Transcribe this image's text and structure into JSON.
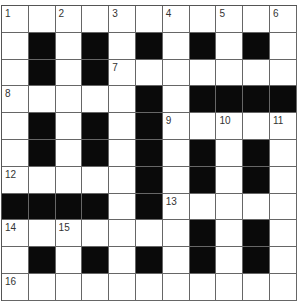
{
  "puzzle": {
    "title_partial": "Everyday Things",
    "rows": 11,
    "cols": 11,
    "colors": {
      "black": "#0a0a0a",
      "white": "#ffffff",
      "line": "#666666"
    },
    "grid": [
      "...........",
      ".#.#.#.#.#.",
      ".#.#.......",
      ".....#.####",
      ".#.#.#.....",
      ".#.#.#.#.#.",
      ".....#.#.#.",
      "####.#.....",
      ".......#.#.",
      ".#.#.#.#.#.",
      "..........."
    ],
    "numbers": [
      {
        "r": 0,
        "c": 0,
        "n": "1"
      },
      {
        "r": 0,
        "c": 2,
        "n": "2"
      },
      {
        "r": 0,
        "c": 4,
        "n": "3"
      },
      {
        "r": 0,
        "c": 6,
        "n": "4"
      },
      {
        "r": 0,
        "c": 8,
        "n": "5"
      },
      {
        "r": 0,
        "c": 10,
        "n": "6"
      },
      {
        "r": 2,
        "c": 4,
        "n": "7"
      },
      {
        "r": 3,
        "c": 0,
        "n": "8"
      },
      {
        "r": 4,
        "c": 6,
        "n": "9"
      },
      {
        "r": 4,
        "c": 8,
        "n": "10"
      },
      {
        "r": 4,
        "c": 10,
        "n": "11"
      },
      {
        "r": 6,
        "c": 0,
        "n": "12"
      },
      {
        "r": 7,
        "c": 6,
        "n": "13"
      },
      {
        "r": 8,
        "c": 0,
        "n": "14"
      },
      {
        "r": 8,
        "c": 2,
        "n": "15"
      },
      {
        "r": 10,
        "c": 0,
        "n": "16"
      }
    ]
  }
}
